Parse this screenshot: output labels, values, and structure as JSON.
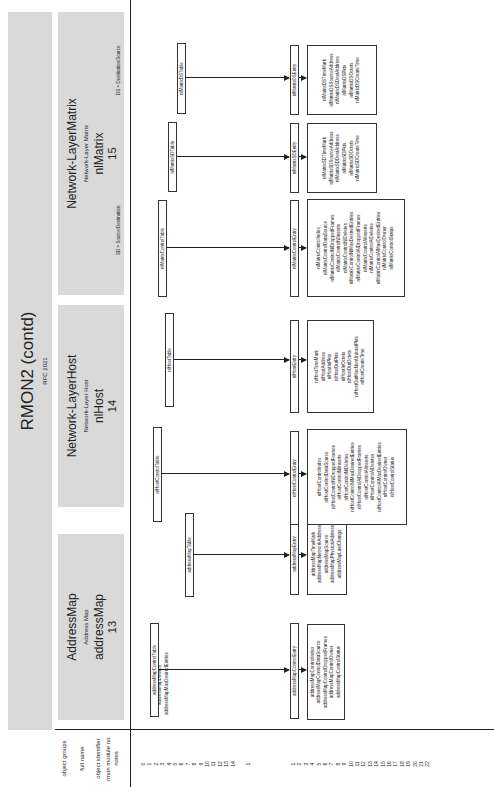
{
  "page": {
    "title": "RMON2 (contd)",
    "subtitle": "RFC 2021"
  },
  "row_labels": {
    "object_groups": "object groups",
    "full_name": "full name",
    "object_identifier": "object identifier",
    "rmon_module_no": "rmon module no.",
    "notes": "notes"
  },
  "groups": [
    {
      "name": "AddressMap",
      "full_name": "Address Map",
      "identifier": "addressMap",
      "module_no": "13",
      "notes": []
    },
    {
      "name": "Network-LayerHost",
      "full_name": "Network-Layer Host",
      "identifier": "nlHost",
      "module_no": "14",
      "notes": []
    },
    {
      "name": "Network-LayerMatrix",
      "full_name": "Network-Layer Matrix",
      "identifier": "nlMatrix",
      "module_no": "15",
      "notes": [
        "SD = Source/Destination",
        "DS = Destination/Source"
      ]
    }
  ],
  "scalars": [
    "addressMapInserts",
    "addressMapDeletes",
    "addressMapMaxDesiredEntries"
  ],
  "tables": [
    {
      "table": "addressMapControlTable",
      "entry": "addressMapControlEntry",
      "columns": [
        "addressMapControlIndex",
        "addressMapControlDataSource",
        "addressMapControlDroppedFrames",
        "addressMapControlOwner",
        "addressMapControlStatus"
      ]
    },
    {
      "table": "addressMapTable",
      "entry": "addressMapEntry",
      "columns": [
        "addressMapTimeMark",
        "addressMapNetworkAddress",
        "addressMapSource",
        "addressMapPhysicalAddress",
        "addressMapLastChange"
      ]
    },
    {
      "table": "nlHostControlTable",
      "entry": "nlHostControlEntry",
      "columns": [
        "nlHostControlIndex",
        "nlHostControlDataSource",
        "nlHostControlNlDroppedFrames",
        "nlHostControlNlInserts",
        "nlHostControlNlDeletes",
        "nlHostControlNlMaxDesiredEntries",
        "nlHostControlAlDroppedFrames",
        "nlHostControlAlInserts",
        "nlHostControlAlDeletes",
        "nlHostControlAlMaxDesiredEntries",
        "nlHostControlOwner",
        "nlHostControlStatus"
      ]
    },
    {
      "table": "nlHostTable",
      "entry": "nlHostEntry",
      "columns": [
        "nlHostTimeMark",
        "nlHostAddress",
        "nlHostInPkts",
        "nlHostOutPkts",
        "nlHostInOctets",
        "nlHostOutOctets",
        "nlHostOutMacNonUnicastPkts",
        "nlHostCreateTime"
      ]
    },
    {
      "table": "nlMatrixControlTable",
      "entry": "nlMatrixControlEntry",
      "columns": [
        "nlMatrixControlIndex",
        "nlMatrixControlDataSource",
        "nlMatrixControlNlDroppedFrames",
        "nlMatrixControlNlInserts",
        "nlMatrixControlNlDeletes",
        "nlMatrixControlNlMaxDesiredEntries",
        "nlMatrixControlAlDroppedFrames",
        "nlMatrixControlAlInserts",
        "nlMatrixControlAlDeletes",
        "nlMatrixControlAlMaxDesiredEntries",
        "nlMatrixControlOwner",
        "nlMatrixControlStatus"
      ]
    },
    {
      "table": "nlMatrixSDTable",
      "entry": "nlMatrixSDEntry",
      "columns": [
        "nlMatrixSDTimeMark",
        "nlMatrixSDSourceAddress",
        "nlMatrixSDDestAddress",
        "nlMatrixSDPkts",
        "nlMatrixSDOctets",
        "nlMatrixSDCreateTime"
      ]
    },
    {
      "table": "nlMatrixDSTable",
      "entry": "nlMatrixDSEntry",
      "columns": [
        "nlMatrixDSTimeMark",
        "nlMatrixDSSourceAddress",
        "nlMatrixDSDestAddress",
        "nlMatrixDSPkts",
        "nlMatrixDSOctets",
        "nlMatrixDSCreateTime"
      ]
    }
  ],
  "row_numbers": {
    "group_a": [
      "0",
      "1",
      "2",
      "3",
      "4",
      "5",
      "6",
      "7",
      "8",
      "9",
      "10",
      "11",
      "12",
      "13",
      "14"
    ],
    "group_b": [
      "1"
    ],
    "group_c": [
      "1",
      "2",
      "3",
      "4",
      "5",
      "6",
      "7",
      "8",
      "9",
      "10",
      "11",
      "12",
      "13",
      "14",
      "15",
      "16",
      "17",
      "18",
      "19",
      "20",
      "21",
      "22"
    ]
  }
}
